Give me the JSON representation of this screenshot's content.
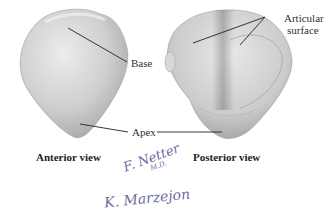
{
  "figure": {
    "labels": {
      "base": "Base",
      "apex": "Apex",
      "articular_surface_line1": "Articular",
      "articular_surface_line2": "surface"
    },
    "views": {
      "anterior": "Anterior view",
      "posterior": "Posterior view"
    },
    "signatures": {
      "netter": "F. Netter",
      "netter_suffix": "M.D.",
      "marzejon": "K. Marzejon"
    },
    "colors": {
      "bone_light": "#e6e6e6",
      "bone_mid": "#c4c4c4",
      "bone_dark": "#9a9a9a",
      "leader_line": "#222222",
      "signature": "#6a6aa0"
    }
  }
}
